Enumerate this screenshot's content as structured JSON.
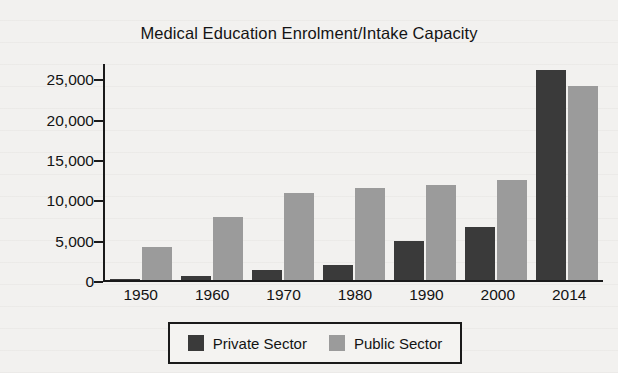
{
  "chart_data": {
    "type": "bar",
    "title": "Medical Education Enrolment/Intake Capacity",
    "xlabel": "",
    "ylabel": "Enrolment/Intake Capacity",
    "categories": [
      "1950",
      "1960",
      "1970",
      "1980",
      "1990",
      "2000",
      "2014"
    ],
    "series": [
      {
        "name": "Private Sector",
        "color": "#3a3a3a",
        "values": [
          100,
          500,
          1300,
          1800,
          4800,
          6600,
          26000
        ]
      },
      {
        "name": "Public Sector",
        "color": "#9b9b9b",
        "values": [
          4100,
          7800,
          10800,
          11400,
          11800,
          12400,
          24000
        ]
      }
    ],
    "ylim": [
      0,
      27000
    ],
    "yticks": [
      0,
      5000,
      10000,
      15000,
      20000,
      25000
    ],
    "ytick_labels": [
      "0",
      "5,000",
      "10,000",
      "15,000",
      "20,000",
      "25,000"
    ],
    "grid": false,
    "legend_position": "bottom",
    "legend": [
      "Private Sector",
      "Public Sector"
    ]
  }
}
